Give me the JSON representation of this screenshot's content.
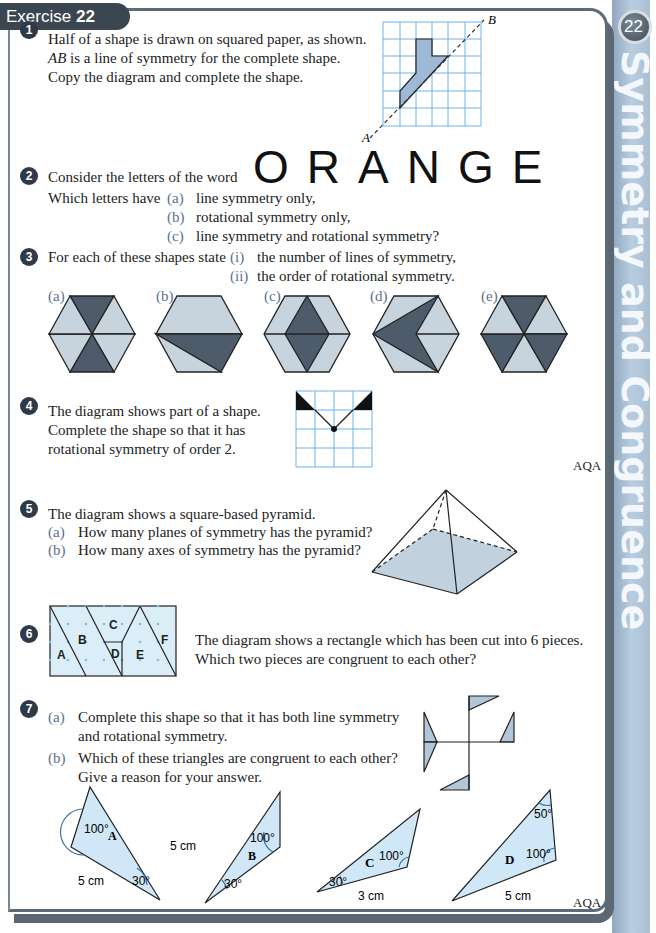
{
  "header": {
    "exercise_word": "Exercise",
    "exercise_number": "22"
  },
  "sidebar": {
    "chapter_number": "22",
    "chapter_title": "Symmetry and Congruence"
  },
  "questions": {
    "q1": {
      "number": "1",
      "lines": [
        "Half of a shape is drawn on squared paper, as shown.",
        "is a line of symmetry for the complete shape.",
        "Copy the diagram and complete the shape."
      ],
      "ab": "AB",
      "label_a": "A",
      "label_b": "B"
    },
    "q2": {
      "number": "2",
      "intro": "Consider the letters of the word",
      "word": "ORANGE",
      "ask": "Which letters have",
      "parts": [
        {
          "label": "(a)",
          "text": "line symmetry only,"
        },
        {
          "label": "(b)",
          "text": "rotational symmetry only,"
        },
        {
          "label": "(c)",
          "text": "line symmetry and rotational symmetry?"
        }
      ]
    },
    "q3": {
      "number": "3",
      "intro": "For each of these shapes state",
      "parts": [
        {
          "label": "(i)",
          "text": "the number of lines of symmetry,"
        },
        {
          "label": "(ii)",
          "text": "the order of rotational symmetry."
        }
      ],
      "shape_labels": [
        "(a)",
        "(b)",
        "(c)",
        "(d)",
        "(e)"
      ]
    },
    "q4": {
      "number": "4",
      "lines": [
        "The diagram shows part of a shape.",
        "Complete the shape so that it has",
        "rotational symmetry of order 2."
      ],
      "source": "AQA"
    },
    "q5": {
      "number": "5",
      "intro": "The diagram shows a square-based pyramid.",
      "parts": [
        {
          "label": "(a)",
          "text": "How many planes of symmetry has the pyramid?"
        },
        {
          "label": "(b)",
          "text": "How many axes of symmetry has the pyramid?"
        }
      ]
    },
    "q6": {
      "number": "6",
      "lines": [
        "The diagram shows a rectangle which has been cut into 6 pieces.",
        "Which two pieces are congruent to each other?"
      ],
      "pieces": [
        "A",
        "B",
        "C",
        "D",
        "E",
        "F"
      ]
    },
    "q7": {
      "number": "7",
      "parts": [
        {
          "label": "(a)",
          "lines": [
            "Complete this shape so that it has both line symmetry",
            "and rotational symmetry."
          ]
        },
        {
          "label": "(b)",
          "lines": [
            "Which of these triangles are congruent to each other?",
            "Give a reason for your answer."
          ]
        }
      ],
      "triangles": [
        {
          "name": "A",
          "angle1": "100°",
          "angle2": "30°",
          "side": "5 cm"
        },
        {
          "name": "B",
          "angle1": "100°",
          "angle2": "30°",
          "side": "5 cm"
        },
        {
          "name": "C",
          "angle1": "100°",
          "angle2": "30°",
          "side": "3 cm"
        },
        {
          "name": "D",
          "angle1": "100°",
          "angle2": "50°",
          "side": "5 cm"
        }
      ],
      "source": "AQA"
    }
  },
  "colors": {
    "dark_fill": "#4d5b6b",
    "light_fill": "#c7d4de",
    "grid": "#6fb2e6",
    "tri_fill": "#cfe7f6",
    "tab": "#3c4650"
  }
}
